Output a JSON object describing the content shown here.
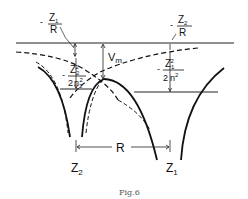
{
  "figure": {
    "caption": "Fig.6",
    "labels": {
      "z1_over_r": {
        "sign": "-",
        "num": "Z",
        "num_sub": "1",
        "den": "R"
      },
      "z2_over_r": {
        "sign": "-",
        "num": "Z",
        "num_sub": "2",
        "den": "R"
      },
      "z2sq_over_2n2sq": {
        "sign": "-",
        "num": "Z",
        "num_sub": "2",
        "num_sup": "2",
        "den": "2",
        "den_n": "n",
        "den_sub": "2",
        "den_sup": "2"
      },
      "z1sq_over_2n2": {
        "sign": "-",
        "num": "Z",
        "num_sub": "1",
        "num_sup": "2",
        "den": "2",
        "den_n": "n",
        "den_sup": "2"
      },
      "vm": {
        "text": "V",
        "sub": "m"
      },
      "distance": "R",
      "nucleus_left": {
        "text": "Z",
        "sub": "2"
      },
      "nucleus_right": {
        "text": "Z",
        "sub": "1"
      }
    },
    "colors": {
      "line": "#111111",
      "caption": "#555555"
    }
  }
}
